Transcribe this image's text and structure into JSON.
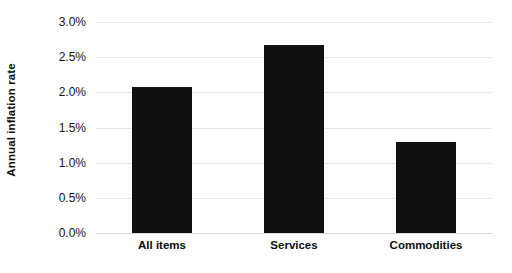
{
  "chart_data": {
    "type": "bar",
    "title": "",
    "xlabel": "",
    "ylabel": "Annual inflation rate",
    "categories": [
      "All items",
      "Services",
      "Commodities"
    ],
    "values": [
      2.08,
      2.67,
      1.3
    ],
    "value_labels": [
      "2.08%",
      "2.67%",
      "1.30%"
    ],
    "series": [
      {
        "name": "Annual inflation rate",
        "values": [
          2.08,
          2.67,
          1.3
        ],
        "color": "#111111"
      }
    ],
    "ylim": [
      0.0,
      3.0
    ],
    "ytick_values": [
      0.0,
      0.5,
      1.0,
      1.5,
      2.0,
      2.5,
      3.0
    ],
    "ytick_labels": [
      "0.0%",
      "0.5%",
      "1.0%",
      "1.5%",
      "2.0%",
      "2.5%",
      "3.0%"
    ],
    "grid": true,
    "grid_axis": "y",
    "grid_color": "#e6e6e6",
    "legend": false,
    "legend_position": "none",
    "bar_color": "#111111",
    "background_color": "#ffffff",
    "annotations": []
  },
  "axes": {
    "y_title": "Annual inflation rate",
    "ticks_y": [
      {
        "label": "3.0%",
        "value": 3.0
      },
      {
        "label": "2.5%",
        "value": 2.5
      },
      {
        "label": "2.0%",
        "value": 2.0
      },
      {
        "label": "1.5%",
        "value": 1.5
      },
      {
        "label": "1.0%",
        "value": 1.0
      },
      {
        "label": "0.5%",
        "value": 0.5
      },
      {
        "label": "0.0%",
        "value": 0.0
      }
    ],
    "ticks_x": [
      {
        "label": "All items"
      },
      {
        "label": "Services"
      },
      {
        "label": "Commodities"
      }
    ]
  }
}
